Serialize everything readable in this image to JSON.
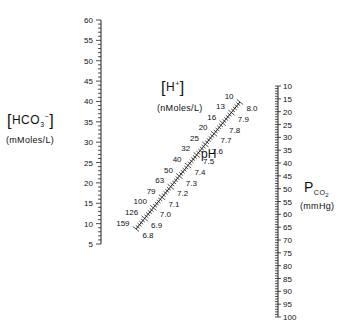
{
  "hco3_scale": {
    "title": "HCO",
    "title_sub": "3",
    "title_sup": "−",
    "unit": "(mMoles/L)",
    "min": 5,
    "max": 60,
    "major_step": 5,
    "minor_step": 1,
    "line_x": 101,
    "y_at_max": 20,
    "y_at_min": 244,
    "tick_labels": [
      "60",
      "55",
      "50",
      "45",
      "40",
      "35",
      "30",
      "25",
      "20",
      "15",
      "10",
      "5"
    ]
  },
  "h_ph_scale": {
    "h_title": "H",
    "h_sup": "+",
    "h_unit": "(nMoles/L)",
    "ph_title": "pH",
    "start_point": [
      136,
      229
    ],
    "end_point": [
      240,
      102
    ],
    "ph_values": [
      "6.8",
      "6.9",
      "7.0",
      "7.1",
      "7.2",
      "7.3",
      "7.4",
      "7.5",
      "7.6",
      "7.7",
      "7.8",
      "7.9",
      "8.0"
    ],
    "h_values": [
      "159",
      "126",
      "100",
      "79",
      "63",
      "50",
      "40",
      "32",
      "25",
      "20",
      "16",
      "13",
      "10"
    ]
  },
  "pco2_scale": {
    "title_p": "P",
    "title_sub": "CO",
    "title_sub2": "2",
    "unit": "(mmHg)",
    "min": 10,
    "max": 100,
    "major_step": 5,
    "minor_step": 1,
    "line_x": 278,
    "y_at_min": 86,
    "y_at_max": 317,
    "tick_labels": [
      "10",
      "15",
      "20",
      "25",
      "30",
      "35",
      "40",
      "45",
      "50",
      "55",
      "60",
      "65",
      "70",
      "75",
      "80",
      "85",
      "90",
      "95",
      "100"
    ]
  }
}
